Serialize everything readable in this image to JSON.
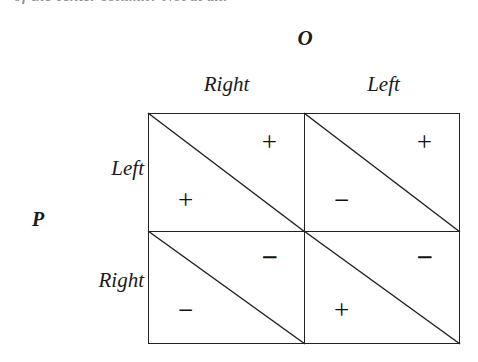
{
  "caption": {
    "text": "of the center column? Not at all."
  },
  "matrix": {
    "column_player": "O",
    "row_player": "P",
    "column_headers": [
      "Right",
      "Left"
    ],
    "row_headers": [
      "Left",
      "Right"
    ],
    "cells": [
      {
        "row": "Left",
        "column": "Right",
        "column_payoff": "+",
        "row_payoff": "+",
        "column_payoff_heavy": false,
        "row_payoff_heavy": false
      },
      {
        "row": "Left",
        "column": "Left",
        "column_payoff": "+",
        "row_payoff": "−",
        "column_payoff_heavy": false,
        "row_payoff_heavy": false
      },
      {
        "row": "Right",
        "column": "Right",
        "column_payoff": "−",
        "row_payoff": "−",
        "column_payoff_heavy": true,
        "row_payoff_heavy": false
      },
      {
        "row": "Right",
        "column": "Left",
        "column_payoff": "−",
        "row_payoff": "+",
        "column_payoff_heavy": true,
        "row_payoff_heavy": false
      }
    ]
  },
  "colors": {
    "ink": "#222222",
    "paper": "#ffffff"
  }
}
